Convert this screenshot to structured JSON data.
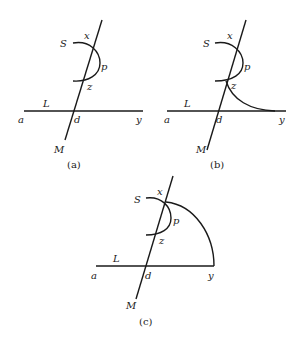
{
  "figure": {
    "panels": [
      {
        "caption": "(a)",
        "labels": {
          "S": "S",
          "x": "x",
          "p": "p",
          "z": "z",
          "L": "L",
          "a": "a",
          "d": "d",
          "y": "y",
          "M": "M"
        }
      },
      {
        "caption": "(b)",
        "labels": {
          "S": "S",
          "x": "x",
          "p": "p",
          "z": "z",
          "L": "L",
          "a": "a",
          "d": "d",
          "y": "y",
          "M": "M"
        }
      },
      {
        "caption": "(c)",
        "labels": {
          "S": "S",
          "x": "x",
          "p": "p",
          "z": "z",
          "L": "L",
          "a": "a",
          "d": "d",
          "y": "y",
          "M": "M"
        }
      }
    ],
    "colors": {
      "ink": "#1a1a1a",
      "background": "#ffffff"
    }
  }
}
